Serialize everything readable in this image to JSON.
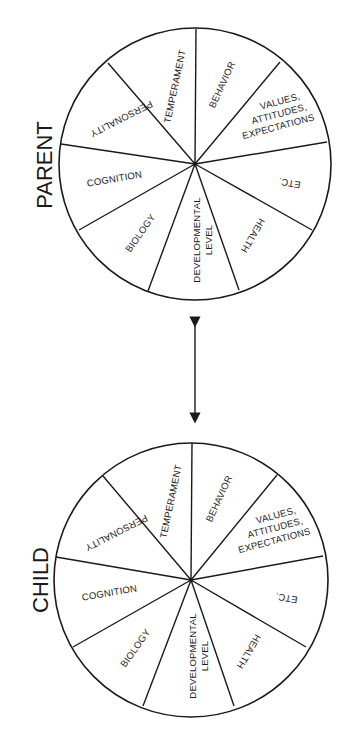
{
  "colors": {
    "ink": "#1a1a1a",
    "background": "#ffffff"
  },
  "wheels": [
    {
      "title": "PARENT",
      "segments": [
        {
          "label": "TEMPERAMENT"
        },
        {
          "label": "BEHAVIOR"
        },
        {
          "lines": [
            "VALUES,",
            "ATTITUDES,",
            "EXPECTATIONS"
          ]
        },
        {
          "label": "ETC."
        },
        {
          "label": "HEALTH"
        },
        {
          "lines": [
            "DEVELOPMENTAL",
            "LEVEL"
          ]
        },
        {
          "label": "BIOLOGY"
        },
        {
          "label": "COGNITION"
        },
        {
          "label": "PERSONALITY"
        }
      ]
    },
    {
      "title": "CHILD",
      "segments": [
        {
          "label": "TEMPERAMENT"
        },
        {
          "label": "BEHAVIOR"
        },
        {
          "lines": [
            "VALUES,",
            "ATTITUDES,",
            "EXPECTATIONS"
          ]
        },
        {
          "label": "ETC."
        },
        {
          "label": "HEALTH"
        },
        {
          "lines": [
            "DEVELOPMENTAL",
            "LEVEL"
          ]
        },
        {
          "label": "BIOLOGY"
        },
        {
          "label": "COGNITION"
        },
        {
          "label": "PERSONALITY"
        }
      ]
    }
  ],
  "connector": {
    "type": "bidirectional-arrow"
  }
}
